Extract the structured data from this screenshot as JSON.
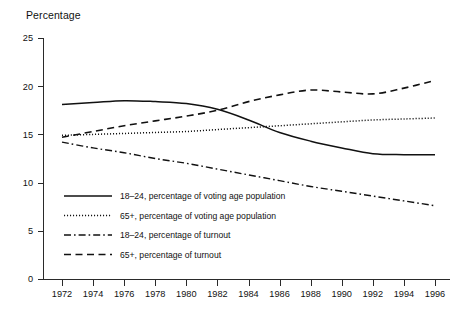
{
  "chart_data": {
    "type": "line",
    "title": "Percentage",
    "xlabel": "",
    "ylabel": "Percentage",
    "xlim": [
      1972,
      1996
    ],
    "ylim": [
      0,
      25
    ],
    "yticks": [
      0,
      5,
      10,
      15,
      20,
      25
    ],
    "xticks": [
      1972,
      1974,
      1976,
      1978,
      1980,
      1982,
      1984,
      1986,
      1988,
      1990,
      1992,
      1994,
      1996
    ],
    "x": [
      1972,
      1974,
      1976,
      1978,
      1980,
      1982,
      1984,
      1986,
      1988,
      1990,
      1992,
      1994,
      1996
    ],
    "grid": false,
    "legend_position": "inside-lower-left",
    "series": [
      {
        "name": "18–24, percentage of voting age population",
        "style": "solid",
        "color": "#111111",
        "values": [
          18.1,
          18.3,
          18.5,
          18.4,
          18.2,
          17.6,
          16.5,
          15.2,
          14.3,
          13.6,
          13.0,
          12.9,
          12.9
        ]
      },
      {
        "name": "65+, percentage of voting age population",
        "style": "dotted",
        "color": "#111111",
        "values": [
          14.9,
          15.0,
          15.1,
          15.2,
          15.3,
          15.5,
          15.7,
          15.9,
          16.1,
          16.3,
          16.5,
          16.6,
          16.7
        ]
      },
      {
        "name": "18–24, percentage of turnout",
        "style": "dashdot",
        "color": "#111111",
        "values": [
          14.2,
          13.6,
          13.1,
          12.5,
          12.0,
          11.4,
          10.8,
          10.2,
          9.6,
          9.1,
          8.6,
          8.1,
          7.6
        ]
      },
      {
        "name": "65+, percentage of turnout",
        "style": "dashed",
        "color": "#111111",
        "values": [
          14.7,
          15.3,
          15.9,
          16.4,
          16.9,
          17.5,
          18.4,
          19.1,
          19.6,
          19.4,
          19.2,
          19.8,
          20.6
        ]
      }
    ]
  },
  "axis": {
    "y_tick_labels": [
      "25",
      "20",
      "15",
      "10",
      "5",
      "0"
    ],
    "x_tick_labels": [
      "1972",
      "1974",
      "1976",
      "1978",
      "1980",
      "1982",
      "1984",
      "1986",
      "1988",
      "1990",
      "1992",
      "1994",
      "1996"
    ]
  },
  "legend": {
    "entries": [
      {
        "label": "18–24, percentage of voting age population",
        "style": "solid"
      },
      {
        "label": "65+, percentage of voting age population",
        "style": "dotted"
      },
      {
        "label": "18–24, percentage of turnout",
        "style": "dashdot"
      },
      {
        "label": "65+, percentage of turnout",
        "style": "dashed"
      }
    ]
  }
}
